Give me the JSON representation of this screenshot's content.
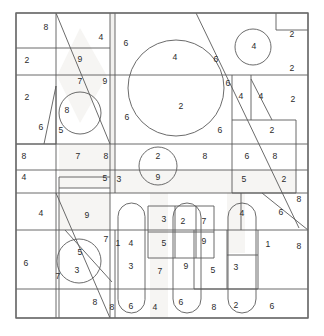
{
  "figure": {
    "canvas": {
      "width": 324,
      "height": 336
    },
    "frame": {
      "x": 16,
      "y": 13,
      "width": 292,
      "height": 305
    },
    "stroke_color": "#5a5a5a",
    "shade_color": "#f2f1ef",
    "background_color": "#ffffff",
    "label_color": "#2b2b2b"
  },
  "labels": [
    {
      "id": "l01",
      "text": "8",
      "x": 46,
      "y": 28
    },
    {
      "id": "l02",
      "text": "4",
      "x": 101,
      "y": 38
    },
    {
      "id": "l03",
      "text": "6",
      "x": 126,
      "y": 44
    },
    {
      "id": "l04",
      "text": "4",
      "x": 254,
      "y": 47
    },
    {
      "id": "l05",
      "text": "2",
      "x": 292,
      "y": 35
    },
    {
      "id": "l06",
      "text": "2",
      "x": 27,
      "y": 61
    },
    {
      "id": "l07",
      "text": "9",
      "x": 80,
      "y": 60
    },
    {
      "id": "l08",
      "text": "4",
      "x": 175,
      "y": 58
    },
    {
      "id": "l09",
      "text": "6",
      "x": 216,
      "y": 60
    },
    {
      "id": "l10",
      "text": "2",
      "x": 292,
      "y": 69
    },
    {
      "id": "l11",
      "text": "7",
      "x": 80,
      "y": 82
    },
    {
      "id": "l12",
      "text": "9",
      "x": 105,
      "y": 82
    },
    {
      "id": "l13",
      "text": "6",
      "x": 228,
      "y": 84
    },
    {
      "id": "l14",
      "text": "2",
      "x": 27,
      "y": 98
    },
    {
      "id": "l15",
      "text": "4",
      "x": 241,
      "y": 97
    },
    {
      "id": "l16",
      "text": "4",
      "x": 261,
      "y": 97
    },
    {
      "id": "l17",
      "text": "2",
      "x": 293,
      "y": 100
    },
    {
      "id": "l18",
      "text": "8",
      "x": 67,
      "y": 111
    },
    {
      "id": "l19",
      "text": "6",
      "x": 127,
      "y": 118
    },
    {
      "id": "l20",
      "text": "2",
      "x": 181,
      "y": 107
    },
    {
      "id": "l21",
      "text": "5",
      "x": 61,
      "y": 131
    },
    {
      "id": "l22",
      "text": "6",
      "x": 41,
      "y": 128
    },
    {
      "id": "l23",
      "text": "6",
      "x": 220,
      "y": 131
    },
    {
      "id": "l24",
      "text": "2",
      "x": 272,
      "y": 131
    },
    {
      "id": "l25",
      "text": "8",
      "x": 24,
      "y": 157
    },
    {
      "id": "l26",
      "text": "7",
      "x": 78,
      "y": 157
    },
    {
      "id": "l27",
      "text": "8",
      "x": 106,
      "y": 157
    },
    {
      "id": "l28",
      "text": "2",
      "x": 158,
      "y": 157
    },
    {
      "id": "l29",
      "text": "8",
      "x": 205,
      "y": 157
    },
    {
      "id": "l30",
      "text": "6",
      "x": 247,
      "y": 157
    },
    {
      "id": "l31",
      "text": "8",
      "x": 275,
      "y": 157
    },
    {
      "id": "l32",
      "text": "9",
      "x": 158,
      "y": 178
    },
    {
      "id": "l33",
      "text": "4",
      "x": 24,
      "y": 178
    },
    {
      "id": "l34",
      "text": "5",
      "x": 105,
      "y": 179
    },
    {
      "id": "l35",
      "text": "3",
      "x": 119,
      "y": 180
    },
    {
      "id": "l36",
      "text": "5",
      "x": 244,
      "y": 180
    },
    {
      "id": "l37",
      "text": "2",
      "x": 284,
      "y": 180
    },
    {
      "id": "l38",
      "text": "4",
      "x": 41,
      "y": 214
    },
    {
      "id": "l39",
      "text": "9",
      "x": 87,
      "y": 216
    },
    {
      "id": "l40",
      "text": "3",
      "x": 164,
      "y": 220
    },
    {
      "id": "l41",
      "text": "2",
      "x": 183,
      "y": 222
    },
    {
      "id": "l42",
      "text": "7",
      "x": 204,
      "y": 222
    },
    {
      "id": "l43",
      "text": "4",
      "x": 242,
      "y": 214
    },
    {
      "id": "l44",
      "text": "6",
      "x": 281,
      "y": 213
    },
    {
      "id": "l45",
      "text": "8",
      "x": 299,
      "y": 200
    },
    {
      "id": "l46",
      "text": "5",
      "x": 164,
      "y": 244
    },
    {
      "id": "l47",
      "text": "9",
      "x": 204,
      "y": 242
    },
    {
      "id": "l48",
      "text": "7",
      "x": 106,
      "y": 240
    },
    {
      "id": "l49",
      "text": "1",
      "x": 118,
      "y": 244
    },
    {
      "id": "l50",
      "text": "4",
      "x": 131,
      "y": 244
    },
    {
      "id": "l51",
      "text": "1",
      "x": 268,
      "y": 245
    },
    {
      "id": "l52",
      "text": "8",
      "x": 299,
      "y": 247
    },
    {
      "id": "l53",
      "text": "6",
      "x": 26,
      "y": 264
    },
    {
      "id": "l54",
      "text": "5",
      "x": 80,
      "y": 253
    },
    {
      "id": "l55",
      "text": "3",
      "x": 77,
      "y": 271
    },
    {
      "id": "l56",
      "text": "7",
      "x": 58,
      "y": 277
    },
    {
      "id": "l57",
      "text": "3",
      "x": 131,
      "y": 267
    },
    {
      "id": "l58",
      "text": "7",
      "x": 160,
      "y": 272
    },
    {
      "id": "l59",
      "text": "9",
      "x": 186,
      "y": 267
    },
    {
      "id": "l60",
      "text": "5",
      "x": 213,
      "y": 271
    },
    {
      "id": "l61",
      "text": "3",
      "x": 236,
      "y": 268
    },
    {
      "id": "l62",
      "text": "8",
      "x": 95,
      "y": 303
    },
    {
      "id": "l63",
      "text": "8",
      "x": 112,
      "y": 308
    },
    {
      "id": "l64",
      "text": "6",
      "x": 131,
      "y": 307
    },
    {
      "id": "l65",
      "text": "4",
      "x": 155,
      "y": 308
    },
    {
      "id": "l66",
      "text": "6",
      "x": 181,
      "y": 303
    },
    {
      "id": "l67",
      "text": "8",
      "x": 214,
      "y": 308
    },
    {
      "id": "l68",
      "text": "2",
      "x": 236,
      "y": 306
    },
    {
      "id": "l69",
      "text": "6",
      "x": 272,
      "y": 307
    }
  ],
  "lines": [
    {
      "id": "ln01",
      "x1": 16,
      "y1": 13,
      "x2": 308,
      "y2": 13
    },
    {
      "id": "ln02",
      "x1": 16,
      "y1": 13,
      "x2": 16,
      "y2": 318
    },
    {
      "id": "ln03",
      "x1": 308,
      "y1": 13,
      "x2": 308,
      "y2": 318
    },
    {
      "id": "ln04",
      "x1": 16,
      "y1": 318,
      "x2": 308,
      "y2": 318
    },
    {
      "id": "ln05",
      "x1": 16,
      "y1": 75,
      "x2": 308,
      "y2": 75
    },
    {
      "id": "ln06",
      "x1": 16,
      "y1": 144,
      "x2": 308,
      "y2": 144
    },
    {
      "id": "ln07",
      "x1": 16,
      "y1": 170,
      "x2": 308,
      "y2": 170
    },
    {
      "id": "ln08",
      "x1": 16,
      "y1": 193,
      "x2": 308,
      "y2": 193
    },
    {
      "id": "ln09",
      "x1": 16,
      "y1": 230,
      "x2": 308,
      "y2": 230
    },
    {
      "id": "ln10",
      "x1": 16,
      "y1": 289,
      "x2": 308,
      "y2": 289
    },
    {
      "id": "ln11",
      "x1": 56,
      "y1": 13,
      "x2": 56,
      "y2": 144
    },
    {
      "id": "ln12",
      "x1": 110,
      "y1": 13,
      "x2": 110,
      "y2": 193
    },
    {
      "id": "ln13",
      "x1": 115,
      "y1": 13,
      "x2": 115,
      "y2": 193
    },
    {
      "id": "ln14",
      "x1": 56,
      "y1": 144,
      "x2": 56,
      "y2": 318
    },
    {
      "id": "ln15",
      "x1": 110,
      "y1": 193,
      "x2": 110,
      "y2": 318
    },
    {
      "id": "ln16",
      "x1": 16,
      "y1": 48,
      "x2": 110,
      "y2": 48
    },
    {
      "id": "ln17",
      "x1": 276,
      "y1": 13,
      "x2": 276,
      "y2": 30
    },
    {
      "id": "ln18",
      "x1": 276,
      "y1": 30,
      "x2": 308,
      "y2": 30
    },
    {
      "id": "ln19",
      "x1": 232,
      "y1": 75,
      "x2": 232,
      "y2": 120
    },
    {
      "id": "ln20",
      "x1": 251,
      "y1": 75,
      "x2": 251,
      "y2": 120
    },
    {
      "id": "ln21",
      "x1": 232,
      "y1": 120,
      "x2": 296,
      "y2": 120
    },
    {
      "id": "ln22",
      "x1": 232,
      "y1": 120,
      "x2": 232,
      "y2": 193
    },
    {
      "id": "ln23",
      "x1": 296,
      "y1": 120,
      "x2": 296,
      "y2": 193
    },
    {
      "id": "ln24",
      "x1": 232,
      "y1": 193,
      "x2": 296,
      "y2": 193
    },
    {
      "id": "ln25",
      "x1": 56,
      "y1": 13,
      "x2": 110,
      "y2": 144
    },
    {
      "id": "ln26",
      "x1": 196,
      "y1": 13,
      "x2": 236,
      "y2": 96
    },
    {
      "id": "ln27",
      "x1": 251,
      "y1": 79,
      "x2": 272,
      "y2": 120
    },
    {
      "id": "ln28",
      "x1": 236,
      "y1": 96,
      "x2": 299,
      "y2": 228
    },
    {
      "id": "ln29",
      "x1": 262,
      "y1": 193,
      "x2": 308,
      "y2": 230
    },
    {
      "id": "ln30",
      "x1": 56,
      "y1": 193,
      "x2": 110,
      "y2": 318
    },
    {
      "id": "ln31",
      "x1": 65,
      "y1": 230,
      "x2": 112,
      "y2": 282
    },
    {
      "id": "ln32",
      "x1": 56,
      "y1": 144,
      "x2": 16,
      "y2": 144
    },
    {
      "id": "ln33",
      "x1": 56,
      "y1": 86,
      "x2": 44,
      "y2": 144
    },
    {
      "id": "ln34",
      "x1": 56,
      "y1": 86,
      "x2": 56,
      "y2": 144
    },
    {
      "id": "ln35",
      "x1": 59,
      "y1": 177,
      "x2": 110,
      "y2": 177
    },
    {
      "id": "ln36",
      "x1": 59,
      "y1": 177,
      "x2": 59,
      "y2": 318
    },
    {
      "id": "ln37",
      "x1": 59,
      "y1": 188,
      "x2": 110,
      "y2": 188
    },
    {
      "id": "ln38",
      "x1": 110,
      "y1": 230,
      "x2": 110,
      "y2": 230
    },
    {
      "id": "ln39",
      "x1": 148,
      "y1": 206,
      "x2": 148,
      "y2": 258
    },
    {
      "id": "ln40",
      "x1": 148,
      "y1": 206,
      "x2": 214,
      "y2": 206
    },
    {
      "id": "ln41",
      "x1": 214,
      "y1": 206,
      "x2": 214,
      "y2": 258
    },
    {
      "id": "ln42",
      "x1": 148,
      "y1": 258,
      "x2": 214,
      "y2": 258
    },
    {
      "id": "ln43",
      "x1": 175,
      "y1": 206,
      "x2": 175,
      "y2": 258
    },
    {
      "id": "ln44",
      "x1": 196,
      "y1": 206,
      "x2": 196,
      "y2": 258
    },
    {
      "id": "ln45",
      "x1": 148,
      "y1": 232,
      "x2": 214,
      "y2": 232
    },
    {
      "id": "ln46",
      "x1": 258,
      "y1": 230,
      "x2": 258,
      "y2": 289
    },
    {
      "id": "ln47",
      "x1": 258,
      "y1": 289,
      "x2": 194,
      "y2": 289
    },
    {
      "id": "ln48",
      "x1": 194,
      "y1": 230,
      "x2": 194,
      "y2": 289
    },
    {
      "id": "ln49",
      "x1": 115,
      "y1": 230,
      "x2": 115,
      "y2": 318
    },
    {
      "id": "ln50",
      "x1": 241,
      "y1": 193,
      "x2": 241,
      "y2": 230
    },
    {
      "id": "ln51",
      "x1": 16,
      "y1": 230,
      "x2": 16,
      "y2": 230
    },
    {
      "id": "ln52",
      "x1": 227,
      "y1": 255,
      "x2": 258,
      "y2": 255
    },
    {
      "id": "ln53",
      "x1": 227,
      "y1": 230,
      "x2": 227,
      "y2": 289
    }
  ],
  "circles": [
    {
      "id": "c1",
      "cx": 176,
      "cy": 88,
      "r": 48
    },
    {
      "id": "c2",
      "cx": 253,
      "cy": 47,
      "r": 18
    },
    {
      "id": "c3",
      "cx": 80,
      "cy": 113,
      "r": 21
    },
    {
      "id": "c4",
      "cx": 158,
      "cy": 166,
      "r": 19
    },
    {
      "id": "c5",
      "cx": 79,
      "cy": 261,
      "r": 22
    }
  ],
  "stadiums": [
    {
      "id": "s1",
      "x": 118,
      "y": 203,
      "width": 27,
      "height": 110
    },
    {
      "id": "s2",
      "x": 173,
      "y": 203,
      "width": 28,
      "height": 110
    },
    {
      "id": "s3",
      "x": 228,
      "y": 203,
      "width": 28,
      "height": 110
    }
  ],
  "polygons": [
    {
      "id": "p1",
      "points": "80,28 107,76 80,123 57,76"
    },
    {
      "id": "p2",
      "points": "56,13 110,144 56,144"
    }
  ]
}
